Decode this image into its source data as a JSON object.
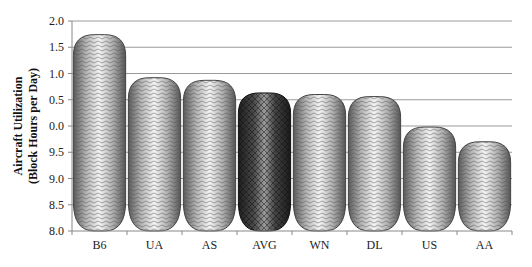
{
  "chart_data": {
    "type": "bar",
    "title": "",
    "xlabel": "",
    "ylabel": "Aircraft Utilization (Block Hours per Day)",
    "ylabel_lines": [
      "Aircraft Utilization",
      "(Block Hours per Day)"
    ],
    "categories": [
      "B6",
      "UA",
      "AS",
      "AVG",
      "WN",
      "DL",
      "US",
      "AA"
    ],
    "values": [
      11.74,
      10.92,
      10.87,
      10.63,
      10.6,
      10.56,
      9.98,
      9.7
    ],
    "highlight": "AVG",
    "ylim": [
      8.0,
      12.0
    ],
    "yticks": [
      8.0,
      8.5,
      9.0,
      9.5,
      10.0,
      10.5,
      11.0,
      11.5,
      12.0
    ],
    "ytick_labels": [
      "8.0",
      "8.5",
      "9.0",
      "9.5",
      "0.0",
      "0.5",
      "1.0",
      "1.5",
      "2.0"
    ],
    "grid": true,
    "legend": null,
    "bar_style": "rounded cylinder with wavy pattern",
    "colors": {
      "bar": "#a8a8a8",
      "highlight_bar": "#3a3a3a",
      "grid": "#9a9a9a",
      "axis": "#888888"
    }
  }
}
